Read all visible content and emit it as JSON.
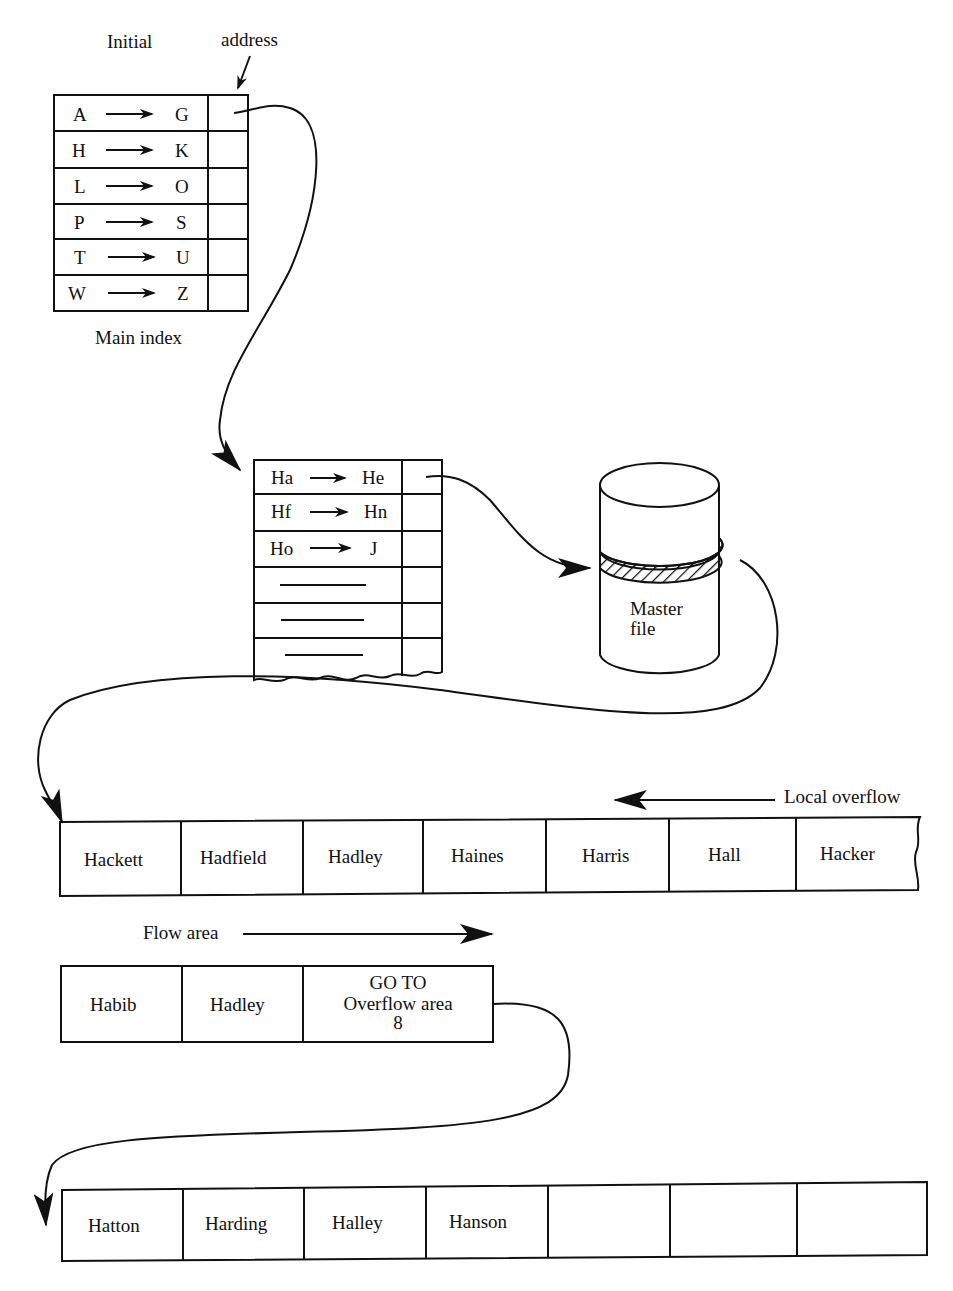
{
  "main_index": {
    "caption": "Main index",
    "label_initial": "Initial",
    "label_address": "address",
    "rows": [
      {
        "from": "A",
        "to": "G"
      },
      {
        "from": "H",
        "to": "K"
      },
      {
        "from": "L",
        "to": "O"
      },
      {
        "from": "P",
        "to": "S"
      },
      {
        "from": "T",
        "to": "U"
      },
      {
        "from": "W",
        "to": "Z"
      }
    ]
  },
  "sub_index": {
    "rows": [
      {
        "from": "Ha",
        "to": "He"
      },
      {
        "from": "Hf",
        "to": "Hn"
      },
      {
        "from": "Ho",
        "to": "J"
      }
    ],
    "blank_rows": 3
  },
  "master_file": {
    "line1": "Master",
    "line2": "file"
  },
  "prime_area": {
    "local_overflow_label": "Local overflow",
    "records": [
      "Hackett",
      "Hadfield",
      "Hadley",
      "Haines",
      "Harris",
      "Hall",
      "Hacker"
    ]
  },
  "flow_area": {
    "label": "Flow area",
    "records": [
      "Habib",
      "Hadley"
    ],
    "goto": {
      "line1": "GO TO",
      "line2": "Overflow area",
      "line3": "8"
    }
  },
  "overflow_area": {
    "records": [
      "Hatton",
      "Harding",
      "Halley",
      "Hanson",
      "",
      "",
      ""
    ]
  },
  "colors": {
    "ink": "#111111",
    "paper": "#ffffff"
  }
}
